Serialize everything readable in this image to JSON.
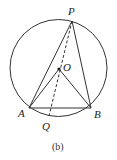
{
  "diagram": {
    "caption": "(b)",
    "stroke_color": "#333333",
    "circle": {
      "cx": 58.5,
      "cy": 68,
      "r": 48.5
    },
    "points": {
      "P": {
        "label": "P",
        "x": 72,
        "y": 21
      },
      "O": {
        "label": "O",
        "x": 59,
        "y": 69
      },
      "A": {
        "label": "A",
        "x": 29,
        "y": 108
      },
      "B": {
        "label": "B",
        "x": 91,
        "y": 108
      },
      "Q": {
        "label": "Q",
        "x": 49,
        "y": 116
      }
    },
    "segments": [
      {
        "from": "P",
        "to": "A",
        "style": "solid"
      },
      {
        "from": "P",
        "to": "B",
        "style": "solid"
      },
      {
        "from": "A",
        "to": "B",
        "style": "solid"
      },
      {
        "from": "O",
        "to": "A",
        "style": "solid"
      },
      {
        "from": "O",
        "to": "B",
        "style": "solid"
      },
      {
        "from": "P",
        "to": "Q",
        "style": "dashed"
      }
    ]
  }
}
